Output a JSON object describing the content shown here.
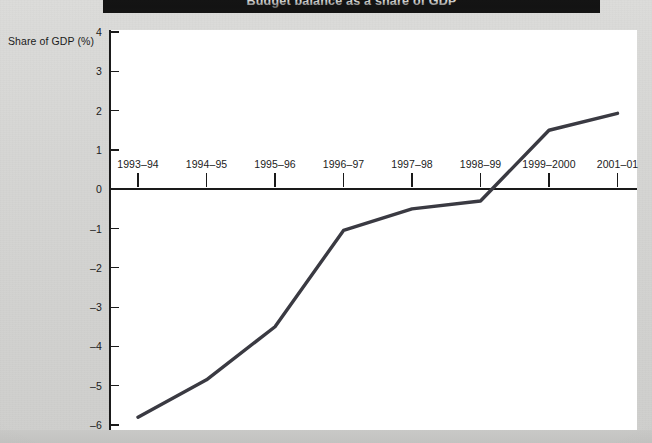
{
  "banner": {
    "text": "Budget balance as a share of GDP"
  },
  "chart_data": {
    "type": "line",
    "title": "",
    "xlabel": "",
    "ylabel": "Share of GDP (%)",
    "categories": [
      "1993–94",
      "1994–95",
      "1995–96",
      "1996–97",
      "1997–98",
      "1998–99",
      "1999–2000",
      "2001–01"
    ],
    "values": [
      -5.8,
      -4.85,
      -3.5,
      -1.05,
      -0.5,
      -0.3,
      1.5,
      1.93
    ],
    "series": [
      {
        "name": "Share of GDP (%)",
        "values": [
          -5.8,
          -4.85,
          -3.5,
          -1.05,
          -0.5,
          -0.3,
          1.5,
          1.93
        ]
      }
    ],
    "ylim": [
      -6,
      4
    ],
    "yticks": [
      4,
      3,
      2,
      1,
      0,
      "–1",
      "–2",
      "–3",
      "–4",
      "–5",
      "–6"
    ],
    "ytick_values": [
      4,
      3,
      2,
      1,
      0,
      -1,
      -2,
      -3,
      -4,
      -5,
      -6
    ],
    "grid": false,
    "legend": "none",
    "line_color": "#3a3a42",
    "zero_line_color": "#1a1a1a",
    "axis_color": "#1a1a1a",
    "plot_background": "#ffffff",
    "page_background": "#d6d6d4"
  }
}
